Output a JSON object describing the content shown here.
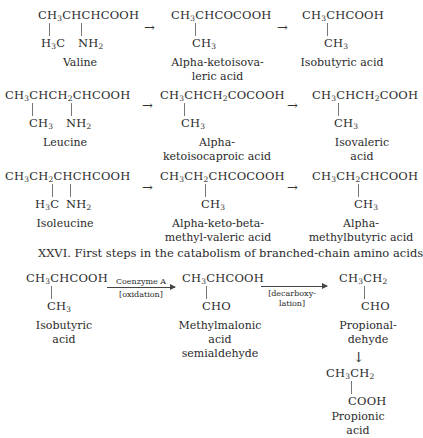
{
  "figure": {
    "caption": "XXVI. First steps in the catabolism of branched-chain amino acids"
  },
  "reactions": [
    {
      "steps": [
        {
          "formula_main": [
            "CH",
            "3",
            "CHCHCOOH"
          ],
          "substituents": [
            "H3C",
            "NH2"
          ],
          "name": "Valine"
        },
        {
          "formula_main": [
            "CH",
            "3",
            "CHCOCOOH"
          ],
          "substituents": [
            "CH3"
          ],
          "name": "Alpha-ketoisova-leric acid"
        },
        {
          "formula_main": [
            "CH",
            "3",
            "CHCOOH"
          ],
          "substituents": [
            "CH3"
          ],
          "name": "Isobutyric acid"
        }
      ]
    },
    {
      "steps": [
        {
          "formula_main": "CH3CHCH2CHCOOH",
          "substituents": [
            "CH3",
            "NH2"
          ],
          "name": "Leucine"
        },
        {
          "formula_main": "CH3CHCH2COCOOH",
          "substituents": [
            "CH3"
          ],
          "name": "Alpha-ketoisocaproic acid"
        },
        {
          "formula_main": "CH3CHCH2COOH",
          "substituents": [
            "CH3"
          ],
          "name": "Isovaleric acid"
        }
      ]
    },
    {
      "steps": [
        {
          "formula_main": "CH3CH2CHCHCOOH",
          "substituents": [
            "H3C",
            "NH2"
          ],
          "name": "Isoleucine"
        },
        {
          "formula_main": "CH3CH2CHCOCOOH",
          "substituents": [
            "CH3"
          ],
          "name": "Alpha-keto-beta-methyl-valeric acid"
        },
        {
          "formula_main": "CH3CH2CHCOOH",
          "substituents": [
            "CH3"
          ],
          "name": "Alpha-methylbutyric acid"
        }
      ]
    }
  ],
  "arrow_symbol": "→",
  "down_arrow_symbol": "↓",
  "pathway": {
    "steps": [
      {
        "formula_main": "CH3CHCOOH",
        "substituent": "CH3",
        "name_line1": "Isobutyric",
        "name_line2": "acid"
      },
      {
        "formula_main": "CH3CHCOOH",
        "substituent": "CHO",
        "name_line1": "Methylmalonic",
        "name_line2": "acid semialdehyde"
      },
      {
        "formula_main": "CH3CH2",
        "substituent": "CHO",
        "name_line1": "Propional-",
        "name_line2": "dehyde"
      },
      {
        "formula_main": "CH3CH2",
        "substituent": "COOH",
        "name_line1": "Propionic",
        "name_line2": "acid"
      }
    ],
    "arrow1": {
      "above": "Coenzyme A",
      "below": "[oxidation]"
    },
    "arrow2": {
      "above": "",
      "below_line1": "[decarboxy-",
      "below_line2": "lation]"
    }
  }
}
